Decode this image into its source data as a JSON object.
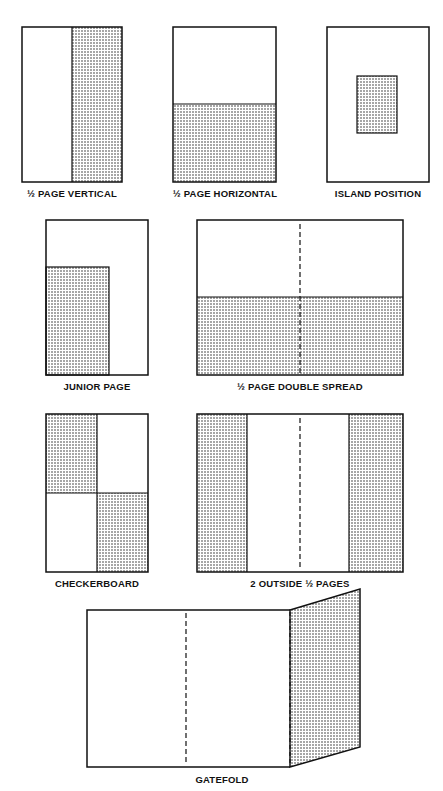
{
  "diagram": {
    "title": "",
    "ink_color": "#111111",
    "paper_color": "#ffffff",
    "panels": [
      {
        "id": "half-page-vertical",
        "label": "1/2 PAGE VERTICAL",
        "label_display": "½ PAGE VERTICAL"
      },
      {
        "id": "half-page-horizontal",
        "label": "1/2 PAGE HORIZONTAL",
        "label_display": "½ PAGE HORIZONTAL"
      },
      {
        "id": "island-position",
        "label": "ISLAND POSITION",
        "label_display": "ISLAND POSITION"
      },
      {
        "id": "junior-page",
        "label": "JUNIOR PAGE",
        "label_display": "JUNIOR PAGE"
      },
      {
        "id": "half-page-double-spread",
        "label": "1/2 PAGE DOUBLE SPREAD",
        "label_display": "½ PAGE DOUBLE SPREAD"
      },
      {
        "id": "checkerboard",
        "label": "CHECKERBOARD",
        "label_display": "CHECKERBOARD"
      },
      {
        "id": "two-outside-half-pages",
        "label": "2 OUTSIDE 1/2 PAGES",
        "label_display": "2 OUTSIDE ½ PAGES"
      },
      {
        "id": "gatefold",
        "label": "GATEFOLD",
        "label_display": "GATEFOLD"
      }
    ]
  }
}
